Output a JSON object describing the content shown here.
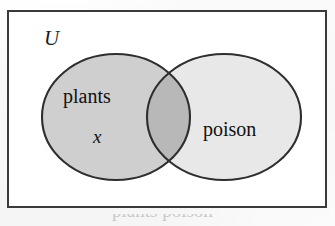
{
  "figure": {
    "name": "venn-diagram",
    "type": "two-set-venn-diagram",
    "universe_label": "U",
    "caption_partial": "plants poison",
    "colors": {
      "frame_border": "#3a3a3a",
      "background": "#ffffff",
      "set_a_fill": "#cfcfcf",
      "set_b_fill": "#e8e8e8",
      "intersection_fill": "#b8b8b8",
      "circle_outline": "#2e2e2e",
      "text": "#111111"
    }
  },
  "sets": [
    {
      "id": "set-a",
      "label": "plants",
      "fill": "#cfcfcf",
      "cx": 116,
      "cy": 117,
      "rx": 74,
      "ry": 63
    },
    {
      "id": "set-b",
      "label": "poison",
      "fill": "#e8e8e8",
      "cx": 224,
      "cy": 117,
      "rx": 77,
      "ry": 63
    }
  ],
  "elements": [
    {
      "id": "element-x",
      "label": "x",
      "region": "set-a-only",
      "x": 100,
      "y": 136
    }
  ],
  "intersection": {
    "id": "intersection-a-b",
    "label": "",
    "fill": "#b8b8b8",
    "empty": true
  }
}
